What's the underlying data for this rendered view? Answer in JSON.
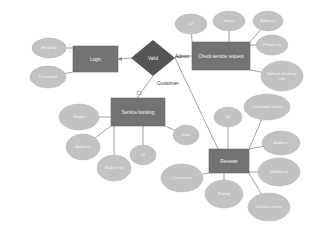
{
  "colors": {
    "entity_fill": "#737373",
    "entity_stroke": "#6a6a6a",
    "attribute_fill": "#c2c2c2",
    "relationship_fill": "#555555",
    "line": "#8c8c8c",
    "text_light": "#f4f4f4",
    "text_dark": "#333333"
  },
  "entities": [
    {
      "id": "login",
      "label": "Login",
      "x": 73,
      "y": 46,
      "w": 45,
      "h": 26
    },
    {
      "id": "check",
      "label": "Check service request",
      "x": 192,
      "y": 42,
      "w": 58,
      "h": 28
    },
    {
      "id": "booking",
      "label": "Service booking",
      "x": 111,
      "y": 98,
      "w": 54,
      "h": 28
    },
    {
      "id": "reviews",
      "label": "Reviews",
      "x": 209,
      "y": 149,
      "w": 40,
      "h": 24
    }
  ],
  "relationship": {
    "id": "valid",
    "label": "Valid",
    "cx": 153,
    "cy": 58,
    "rx": 22,
    "ry": 18
  },
  "edge_labels": [
    {
      "label": "Admin",
      "x": 175,
      "y": 58
    },
    {
      "label": "Customer",
      "x": 157,
      "y": 85
    }
  ],
  "attributes": [
    {
      "entity": "login",
      "label": "Email id",
      "cx": 49,
      "cy": 48,
      "rx": 17,
      "ry": 10
    },
    {
      "entity": "login",
      "label": "Password",
      "cx": 48,
      "cy": 77,
      "rx": 18,
      "ry": 11
    },
    {
      "entity": "check",
      "label": "Id",
      "cx": 191,
      "cy": 24,
      "rx": 16,
      "ry": 10
    },
    {
      "entity": "check",
      "label": "Name",
      "cx": 229,
      "cy": 21,
      "rx": 16,
      "ry": 10
    },
    {
      "entity": "check",
      "label": "Address",
      "cx": 268,
      "cy": 21,
      "rx": 15,
      "ry": 10
    },
    {
      "entity": "check",
      "label": "Phone no",
      "cx": 272,
      "cy": 45,
      "rx": 16,
      "ry": 10
    },
    {
      "entity": "check",
      "label": "Vehicle booking info",
      "cx": 282,
      "cy": 76,
      "rx": 21,
      "ry": 15
    },
    {
      "entity": "booking",
      "label": "Name",
      "cx": 79,
      "cy": 117,
      "rx": 20,
      "ry": 13
    },
    {
      "entity": "booking",
      "label": "Address",
      "cx": 83,
      "cy": 147,
      "rx": 17,
      "ry": 13
    },
    {
      "entity": "booking",
      "label": "Mobile no",
      "cx": 114,
      "cy": 168,
      "rx": 17,
      "ry": 13
    },
    {
      "entity": "booking",
      "label": "Id",
      "cx": 143,
      "cy": 155,
      "rx": 13,
      "ry": 10
    },
    {
      "entity": "booking",
      "label": "Date",
      "cx": 186,
      "cy": 135,
      "rx": 13,
      "ry": 10
    },
    {
      "entity": "reviews",
      "label": "Id",
      "cx": 228,
      "cy": 117,
      "rx": 14,
      "ry": 10
    },
    {
      "entity": "reviews",
      "label": "Customer name",
      "cx": 267,
      "cy": 107,
      "rx": 23,
      "ry": 13
    },
    {
      "entity": "reviews",
      "label": "Address",
      "cx": 281,
      "cy": 143,
      "rx": 19,
      "ry": 12
    },
    {
      "entity": "reviews",
      "label": "Mobile no",
      "cx": 279,
      "cy": 172,
      "rx": 21,
      "ry": 14
    },
    {
      "entity": "reviews",
      "label": "Service name",
      "cx": 269,
      "cy": 207,
      "rx": 21,
      "ry": 14
    },
    {
      "entity": "reviews",
      "label": "Rating",
      "cx": 224,
      "cy": 194,
      "rx": 19,
      "ry": 14
    },
    {
      "entity": "reviews",
      "label": "Comments",
      "cx": 182,
      "cy": 178,
      "rx": 21,
      "ry": 14
    }
  ],
  "links": [
    {
      "from": "valid",
      "to": "login",
      "x1": 131,
      "y1": 58,
      "x2": 118,
      "y2": 59,
      "arrow": true
    },
    {
      "from": "valid",
      "to": "check",
      "x1": 175,
      "y1": 57,
      "x2": 192,
      "y2": 56
    },
    {
      "from": "valid",
      "to": "booking",
      "x1": 153,
      "y1": 76,
      "x2": 137,
      "y2": 98
    },
    {
      "from": "valid",
      "to": "reviews",
      "x1": 175,
      "y1": 58,
      "x2": 218,
      "y2": 149
    }
  ]
}
